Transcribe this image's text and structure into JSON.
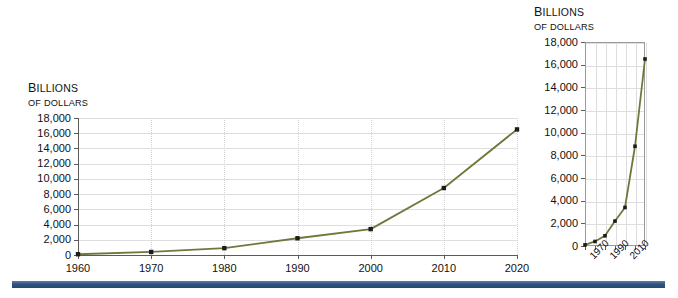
{
  "main_chart": {
    "axis_title_line1": "Billions",
    "axis_title_line2": "of dollars",
    "y_ticks": [
      "18,000",
      "16,000",
      "14,000",
      "12,000",
      "10,000",
      "8,000",
      "6,000",
      "4,000",
      "2,000",
      "0"
    ],
    "x_ticks": [
      "1960",
      "1970",
      "1980",
      "1990",
      "2000",
      "2010",
      "2020"
    ]
  },
  "inset_chart": {
    "axis_title_line1": "Billions",
    "axis_title_line2": "of dollars",
    "y_ticks": [
      "18,000",
      "16,000",
      "14,000",
      "12,000",
      "10,000",
      "8,000",
      "6,000",
      "4,000",
      "2,000",
      "0"
    ],
    "x_ticks": [
      "1970",
      "1990",
      "2010"
    ]
  },
  "colors": {
    "series_line": "#6b7a3a",
    "marker": "#1c1c1c",
    "gridline": "#dedede",
    "axis": "#5b5b5b",
    "bottom_bar": "#2f5480"
  },
  "chart_data": [
    {
      "type": "line",
      "id": "main",
      "title": "",
      "subtitle": "",
      "xlabel": "",
      "ylabel": "Billions of dollars",
      "x": [
        1960,
        1970,
        1980,
        1990,
        2000,
        2010,
        2020
      ],
      "categories": [
        "1960",
        "1970",
        "1980",
        "1990",
        "2000",
        "2010",
        "2020"
      ],
      "values": [
        100,
        400,
        900,
        2200,
        3400,
        8800,
        16500
      ],
      "series": [
        {
          "name": "Billions of dollars",
          "values": [
            100,
            400,
            900,
            2200,
            3400,
            8800,
            16500
          ]
        }
      ],
      "xlim": [
        1960,
        2020
      ],
      "ylim": [
        0,
        18000
      ],
      "ytick_values": [
        0,
        2000,
        4000,
        6000,
        8000,
        10000,
        12000,
        14000,
        16000,
        18000
      ],
      "xtick_values": [
        1960,
        1970,
        1980,
        1990,
        2000,
        2010,
        2020
      ],
      "grid": "horizontal-and-vertical",
      "legend": "none",
      "markers": true
    },
    {
      "type": "line",
      "id": "inset",
      "title": "",
      "subtitle": "",
      "xlabel": "",
      "ylabel": "Billions of dollars",
      "x": [
        1960,
        1970,
        1980,
        1990,
        2000,
        2010,
        2020
      ],
      "categories": [
        "1960",
        "1970",
        "1980",
        "1990",
        "2000",
        "2010",
        "2020"
      ],
      "values": [
        100,
        400,
        900,
        2200,
        3400,
        8800,
        16500
      ],
      "series": [
        {
          "name": "Billions of dollars",
          "values": [
            100,
            400,
            900,
            2200,
            3400,
            8800,
            16500
          ]
        }
      ],
      "xlim": [
        1960,
        2020
      ],
      "ylim": [
        0,
        18000
      ],
      "ytick_values": [
        0,
        2000,
        4000,
        6000,
        8000,
        10000,
        12000,
        14000,
        16000,
        18000
      ],
      "xtick_values": [
        1960,
        1970,
        1980,
        1990,
        2000,
        2010,
        2020
      ],
      "xtick_labels_shown": [
        1970,
        1990,
        2010
      ],
      "grid": "horizontal-and-vertical",
      "legend": "none",
      "markers": true
    }
  ]
}
